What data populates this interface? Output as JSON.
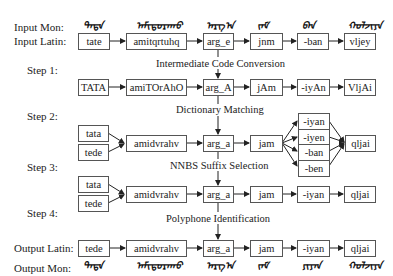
{
  "row_labels": {
    "input_mon": "Input Mon:",
    "input_latin": "Input Latin:",
    "step1": "Step 1:",
    "step2": "Step 2:",
    "step3": "Step 3:",
    "step4": "Step 4:",
    "output_latin": "Output Latin:",
    "output_mon": "Output Mon:"
  },
  "captions": {
    "step1": "Intermediate Code Conversion",
    "step2": "Dictionary Matching",
    "step3": "NNBS Suffix Selection",
    "step4": "Polyphone Identification"
  },
  "mongolian_glyph_placeholders": {
    "input": [
      "ᠲᠠᠲᠡ",
      "ᠠᠮᠢᠳᠤᠷᠠᠬᠤ",
      "ᠠᠷᠭ᠎ᠠ",
      "ᠵᠠᠮ",
      "ᠪᠠᠨ",
      "ᠬᠣᠯᠵᠢᠶᠠ"
    ],
    "output": [
      "ᠲᠠᠲᠡ",
      "ᠠᠮᠢᠳᠤᠷᠠᠬᠤ",
      "ᠠᠷᠭ᠎ᠠ",
      "ᠵᠠᠮ",
      "ᠶᠢᠶᠠᠨ",
      "ᠬᠣᠯᠵᠢᠶᠠ"
    ]
  },
  "input_latin": [
    "tate",
    "amitqrtuhq",
    "arg_e",
    "jnm",
    "-ban",
    "vljey"
  ],
  "step1": [
    "TATA",
    "amiTOrAhO",
    "arg_A",
    "jAm",
    "-iyAn",
    "VljAi"
  ],
  "step2": {
    "first_candidates": [
      "tata",
      "tede"
    ],
    "words": [
      "amidvrahv",
      "arg_a",
      "jam"
    ],
    "suffix_candidates": [
      "-iyan",
      "-iyen",
      "-ban",
      "-ben"
    ],
    "last": "qljai"
  },
  "step3": {
    "first_candidates": [
      "tata",
      "tede"
    ],
    "words": [
      "amidvrahv",
      "arg_a",
      "jam",
      "-iyan",
      "qljai"
    ]
  },
  "output_latin": [
    "tede",
    "amidvrahv",
    "arg_a",
    "jam",
    "-iyan",
    "qljai"
  ]
}
